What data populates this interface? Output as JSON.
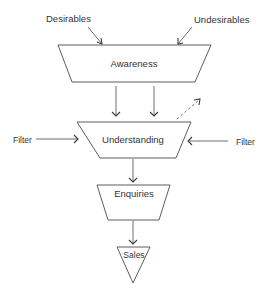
{
  "diagram": {
    "type": "funnel",
    "inputs": {
      "top_left": "Desirables",
      "top_right": "Undesirables",
      "side_left": "Filter",
      "side_right": "Filter"
    },
    "stages": [
      {
        "label": "Awareness"
      },
      {
        "label": "Understanding"
      },
      {
        "label": "Enquiries"
      },
      {
        "label": "Sales"
      }
    ],
    "colors": {
      "stroke": "#4a4a4a",
      "text": "#333333",
      "background": "#ffffff"
    }
  }
}
